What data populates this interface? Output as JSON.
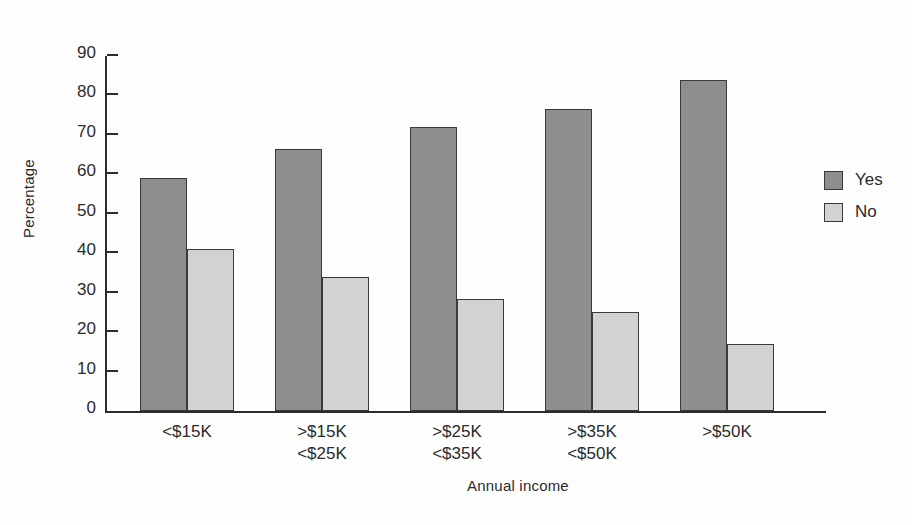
{
  "chart_data": {
    "type": "bar",
    "title": "",
    "xlabel": "Annual income",
    "ylabel": "Percentage",
    "ylim": [
      0,
      90
    ],
    "ytick_step": 10,
    "yticks": [
      90,
      80,
      70,
      60,
      50,
      40,
      30,
      20,
      10,
      0
    ],
    "grid": false,
    "legend_position": "right",
    "categories": [
      "<$15K",
      ">$15K\n<$25K",
      ">$25K\n<$35K",
      ">$35K\n<$50K",
      ">$50K"
    ],
    "category_lines": [
      {
        "line1": "<$15K",
        "line2": ""
      },
      {
        "line1": ">$15K",
        "line2": "<$25K"
      },
      {
        "line1": ">$25K",
        "line2": "<$35K"
      },
      {
        "line1": ">$35K",
        "line2": "<$50K"
      },
      {
        "line1": ">$50K",
        "line2": ""
      }
    ],
    "series": [
      {
        "name": "Yes",
        "color": "#8e8e8e",
        "values": [
          59,
          66.5,
          72,
          76.5,
          84
        ]
      },
      {
        "name": "No",
        "color": "#d2d2d2",
        "values": [
          41,
          34,
          28.5,
          25,
          17
        ]
      }
    ]
  },
  "legend": {
    "items": [
      {
        "label": "Yes",
        "color": "#8e8e8e"
      },
      {
        "label": "No",
        "color": "#d2d2d2"
      }
    ]
  },
  "axes": {
    "y_title": "Percentage",
    "x_title": "Annual income"
  },
  "colors": {
    "yes": "#8e8e8e",
    "no": "#d2d2d2",
    "axis": "#2b2b2b",
    "bar_stroke": "#3a3a3a",
    "background": "#ffffff"
  }
}
